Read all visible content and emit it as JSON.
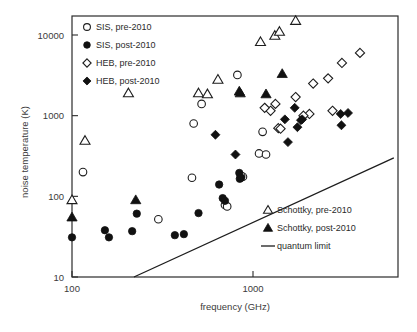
{
  "chart_data": {
    "type": "scatter",
    "title": "",
    "xlabel": "frequency (GHz)",
    "ylabel": "noise temperature (K)",
    "xscale": "log",
    "yscale": "log",
    "xlim": [
      100,
      6000
    ],
    "ylim": [
      10,
      20000
    ],
    "xticks": [
      100,
      1000
    ],
    "xtick_labels": [
      "100",
      "1000"
    ],
    "yticks": [
      10,
      100,
      1000,
      10000
    ],
    "ytick_labels": [
      "10",
      "100",
      "1000",
      "10000"
    ],
    "grid": false,
    "legend_position": [
      "top-left",
      "bottom-right"
    ],
    "series": [
      {
        "name": "SIS, pre-2010",
        "marker": "open-circle",
        "points": [
          [
            115,
            200
          ],
          [
            300,
            52
          ],
          [
            460,
            170
          ],
          [
            470,
            800
          ],
          [
            520,
            1400
          ],
          [
            700,
            78
          ],
          [
            720,
            75
          ],
          [
            820,
            3200
          ],
          [
            1080,
            340
          ],
          [
            1130,
            630
          ],
          [
            1180,
            330
          ],
          [
            880,
            175
          ],
          [
            860,
            180
          ]
        ]
      },
      {
        "name": "SIS, post-2010",
        "marker": "solid-circle",
        "points": [
          [
            100,
            31
          ],
          [
            152,
            38
          ],
          [
            160,
            31
          ],
          [
            215,
            37
          ],
          [
            228,
            61
          ],
          [
            370,
            33
          ],
          [
            415,
            34
          ],
          [
            500,
            62
          ],
          [
            650,
            140
          ],
          [
            680,
            95
          ],
          [
            700,
            88
          ],
          [
            840,
            195
          ],
          [
            845,
            165
          ],
          [
            860,
            170
          ]
        ]
      },
      {
        "name": "HEB, pre-2010",
        "marker": "open-diamond",
        "points": [
          [
            1250,
            1150
          ],
          [
            1330,
            1400
          ],
          [
            1380,
            700
          ],
          [
            1420,
            690
          ],
          [
            1720,
            1700
          ],
          [
            2050,
            1050
          ],
          [
            2150,
            2500
          ],
          [
            2600,
            2900
          ],
          [
            3100,
            4500
          ],
          [
            3900,
            6000
          ],
          [
            1900,
            1000
          ],
          [
            2750,
            1150
          ],
          [
            1160,
            1250
          ]
        ]
      },
      {
        "name": "HEB, post-2010",
        "marker": "solid-diamond",
        "points": [
          [
            620,
            580
          ],
          [
            800,
            330
          ],
          [
            1500,
            900
          ],
          [
            1560,
            470
          ],
          [
            1700,
            1250
          ],
          [
            1760,
            720
          ],
          [
            1840,
            880
          ],
          [
            1870,
            900
          ],
          [
            3050,
            1050
          ],
          [
            3350,
            1080
          ],
          [
            3080,
            760
          ]
        ]
      },
      {
        "name": "Schottky, pre-2010",
        "marker": "open-triangle",
        "points": [
          [
            100,
            90
          ],
          [
            118,
            490
          ],
          [
            205,
            1900
          ],
          [
            500,
            1900
          ],
          [
            560,
            1850
          ],
          [
            640,
            2800
          ],
          [
            1100,
            8200
          ],
          [
            1320,
            9800
          ],
          [
            1400,
            11000
          ],
          [
            1720,
            15000
          ]
        ]
      },
      {
        "name": "Schottky, post-2010",
        "marker": "solid-triangle",
        "points": [
          [
            100,
            55
          ],
          [
            225,
            90
          ],
          [
            840,
            2000
          ],
          [
            850,
            1900
          ],
          [
            1180,
            1850
          ],
          [
            1450,
            3300
          ]
        ]
      }
    ],
    "reference_line": {
      "name": "quantum limit",
      "x": [
        220,
        6000
      ],
      "y": [
        10,
        300
      ]
    }
  },
  "legend_top": {
    "items": [
      {
        "label": "SIS, pre-2010",
        "marker": "open-circle"
      },
      {
        "label": "SIS, post-2010",
        "marker": "solid-circle"
      },
      {
        "label": "HEB, pre-2010",
        "marker": "open-diamond"
      },
      {
        "label": "HEB, post-2010",
        "marker": "solid-diamond"
      }
    ]
  },
  "legend_bottom": {
    "items": [
      {
        "label": "Schottky, pre-2010",
        "marker": "open-triangle"
      },
      {
        "label": "Schottky, post-2010",
        "marker": "solid-triangle"
      },
      {
        "label": "quantum limit",
        "marker": "line"
      }
    ]
  },
  "colors": {
    "axis": "#2b2b2b",
    "marker_fill": "#111111",
    "marker_open": "#ffffff",
    "background": "#ffffff"
  }
}
